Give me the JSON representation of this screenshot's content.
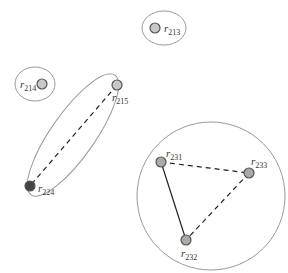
{
  "diagram": {
    "groups": [
      {
        "id": "g213",
        "shape": "ellipse",
        "cx": 164,
        "cy": 28,
        "rx": 22,
        "ry": 17
      },
      {
        "id": "g214",
        "shape": "ellipse",
        "cx": 35,
        "cy": 84,
        "rx": 20,
        "ry": 17
      },
      {
        "id": "g215_224",
        "shape": "ellipse",
        "cx": 73,
        "cy": 135,
        "rx": 22,
        "ry": 73,
        "rotate": 35
      },
      {
        "id": "g23x",
        "shape": "circle",
        "cx": 211,
        "cy": 196,
        "r": 74
      }
    ],
    "nodes": [
      {
        "id": "r213",
        "label": "r",
        "sub": "213",
        "x": 155,
        "y": 28,
        "fill": "#c8c8c8",
        "lx": 164,
        "ly": 32
      },
      {
        "id": "r214",
        "label": "r",
        "sub": "214",
        "x": 42,
        "y": 84,
        "fill": "#c8c8c8",
        "lx": 20,
        "ly": 88
      },
      {
        "id": "r215",
        "label": "r",
        "sub": "215",
        "x": 117,
        "y": 85,
        "fill": "#c8c8c8",
        "lx": 112,
        "ly": 101
      },
      {
        "id": "r224",
        "label": "r",
        "sub": "224",
        "x": 30,
        "y": 186,
        "fill": "#444444",
        "lx": 38,
        "ly": 192
      },
      {
        "id": "r231",
        "label": "r",
        "sub": "231",
        "x": 161,
        "y": 162,
        "fill": "#aaaaaa",
        "lx": 166,
        "ly": 157
      },
      {
        "id": "r233",
        "label": "r",
        "sub": "233",
        "x": 249,
        "y": 173,
        "fill": "#aaaaaa",
        "lx": 251,
        "ly": 165
      },
      {
        "id": "r232",
        "label": "r",
        "sub": "232",
        "x": 186,
        "y": 240,
        "fill": "#aaaaaa",
        "lx": 181,
        "ly": 257
      }
    ],
    "edges": [
      {
        "from": "r215",
        "to": "r224",
        "style": "dashed"
      },
      {
        "from": "r231",
        "to": "r233",
        "style": "dashed"
      },
      {
        "from": "r233",
        "to": "r232",
        "style": "dashed"
      },
      {
        "from": "r231",
        "to": "r232",
        "style": "solid"
      }
    ],
    "colors": {
      "group_stroke": "#999999",
      "edge": "#222222",
      "node_stroke": "#555555"
    }
  }
}
